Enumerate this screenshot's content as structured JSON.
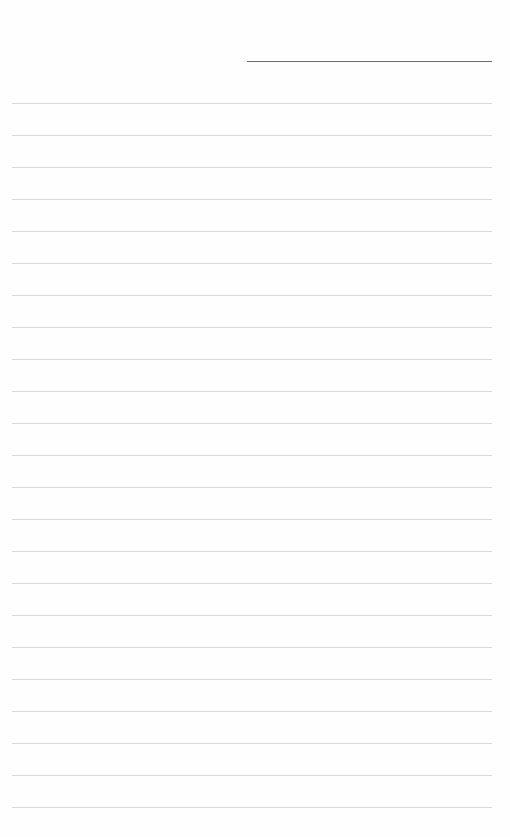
{
  "document": {
    "type": "ruled-notebook-page",
    "title": "",
    "page_width": 510,
    "page_height": 837,
    "background_color": "#ffffff",
    "paper_color": "#fefefe",
    "body_text": "",
    "has_text_content": false
  },
  "header": {
    "name": "title-underline",
    "color": "#6e6e6e",
    "thickness_px": 1,
    "x_start": 247,
    "x_end": 492,
    "width": 245,
    "y": 61,
    "label": ""
  },
  "ruling": {
    "name": "body-ruled-lines",
    "color": "#d9d9dc",
    "thickness_px": 1,
    "x_start": 12,
    "x_end": 492,
    "width": 480,
    "first_line_y": 103,
    "spacing_px": 32,
    "count": 23,
    "line_y_positions": [
      103,
      135,
      167,
      199,
      231,
      263,
      295,
      327,
      359,
      391,
      423,
      455,
      487,
      519,
      551,
      583,
      615,
      647,
      679,
      711,
      743,
      775,
      807
    ]
  },
  "margins": {
    "top_blank_height": 61,
    "left_margin": 12,
    "right_margin": 18,
    "bottom_blank_height": 30
  },
  "footer": {
    "page_number": "",
    "note": ""
  }
}
